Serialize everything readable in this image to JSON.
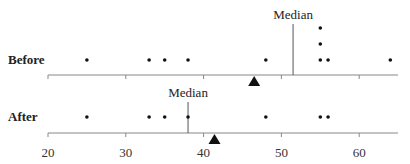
{
  "chart_data": {
    "type": "scatter",
    "subtype": "dot-plot",
    "title": "",
    "xlabel": "",
    "ylabel": "",
    "xlim": [
      20,
      65
    ],
    "xticks": [
      20,
      30,
      40,
      50,
      60
    ],
    "tick_labels": [
      "20",
      "30",
      "40",
      "50",
      "60"
    ],
    "grid": false,
    "legend": null,
    "series": [
      {
        "name": "Before",
        "values": [
          25,
          33,
          35,
          38,
          48,
          55,
          55,
          55,
          56,
          64
        ],
        "median": 51.5,
        "median_label": "Median",
        "mean": 46.5,
        "mean_marker": "triangle"
      },
      {
        "name": "After",
        "values": [
          25,
          33,
          35,
          38,
          48,
          55,
          56
        ],
        "median": 38,
        "median_label": "Median",
        "mean": 41.4,
        "mean_marker": "triangle"
      }
    ]
  },
  "colors": {
    "axis": "#888888",
    "dot": "#111111",
    "median_line": "#555555",
    "triangle": "#111111",
    "text": "#222222"
  }
}
